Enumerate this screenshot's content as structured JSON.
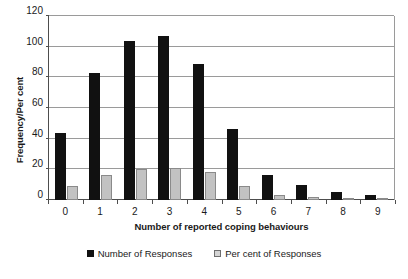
{
  "chart_data": {
    "type": "bar",
    "title": "",
    "subtitle": "",
    "xlabel": "Number of reported coping behaviours",
    "ylabel": "Frequency/Per cent",
    "categories": [
      "0",
      "1",
      "2",
      "3",
      "4",
      "5",
      "6",
      "7",
      "8",
      "9"
    ],
    "series": [
      {
        "name": "Number of Responses",
        "color": "#111111",
        "values": [
          44,
          83,
          104,
          107,
          89,
          46,
          16,
          10,
          5,
          3
        ]
      },
      {
        "name": "Per cent of Responses",
        "color": "#c2c2c2",
        "values": [
          9,
          16,
          20,
          21,
          18,
          9,
          3,
          2,
          1,
          0.5
        ]
      }
    ],
    "ylim": [
      0,
      120
    ],
    "yticks": [
      0,
      20,
      40,
      60,
      80,
      100,
      120
    ],
    "ytick_labels": [
      "0",
      "20",
      "40",
      "60",
      "80",
      "100",
      "120"
    ],
    "grid": "horizontal",
    "legend_position": "bottom",
    "legend_entries": [
      "Number of Responses",
      "Per cent of Responses"
    ]
  }
}
